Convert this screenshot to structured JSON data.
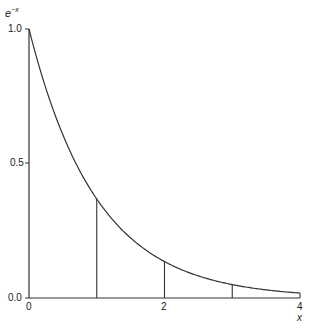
{
  "chart_data": {
    "type": "line",
    "title": "",
    "ylabel": "e^-x",
    "xlabel": "x",
    "xlim": [
      0,
      4
    ],
    "ylim": [
      0,
      1.0
    ],
    "x_ticks": [
      "0",
      "2",
      "4"
    ],
    "y_ticks": [
      "0.0",
      "0.5",
      "1.0"
    ],
    "grid": false,
    "series": [
      {
        "name": "e^-x",
        "x": [
          0,
          0.5,
          1,
          1.5,
          2,
          2.5,
          3,
          3.5,
          4
        ],
        "values": [
          1.0,
          0.607,
          0.368,
          0.223,
          0.135,
          0.082,
          0.05,
          0.03,
          0.018
        ]
      }
    ],
    "annotations": [
      {
        "type": "vertical-line",
        "x": 1,
        "to_y": 0.368
      },
      {
        "type": "vertical-line",
        "x": 2,
        "to_y": 0.135
      },
      {
        "type": "vertical-line",
        "x": 3,
        "to_y": 0.05
      },
      {
        "type": "vertical-line",
        "x": 4,
        "to_y": 0.018
      }
    ]
  },
  "labels": {
    "ylabel_base": "e",
    "ylabel_sup": "−x",
    "xlabel": "x",
    "y_1": "1.0",
    "y_05": "0.5",
    "y_0": "0.0",
    "x_0": "0",
    "x_2": "2",
    "x_4": "4"
  }
}
